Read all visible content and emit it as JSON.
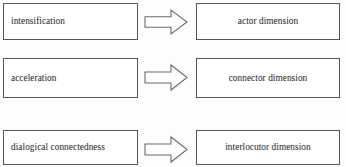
{
  "diagram": {
    "type": "mapping-diagram",
    "orientation": "left-to-right",
    "arrow_icon": "block-arrow-right-icon",
    "rows": [
      {
        "source": "intensification",
        "target": "actor dimension",
        "connector": "block-arrow-right"
      },
      {
        "source": "acceleration",
        "target": "connector dimension",
        "connector": "block-arrow-right"
      },
      {
        "source": "dialogical connectedness",
        "target": "interlocutor dimension",
        "connector": "block-arrow-right"
      }
    ],
    "colors": {
      "background": "#fdfdfc",
      "box_fill": "#ffffff",
      "box_border": "#555552",
      "arrow_stroke": "#6a6a66",
      "text": "#1b1b1b"
    }
  }
}
